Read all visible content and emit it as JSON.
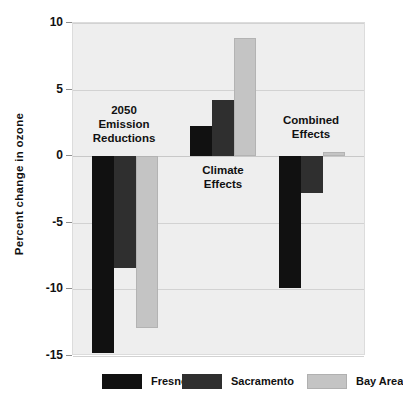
{
  "chart_data": {
    "type": "bar",
    "title": "",
    "xlabel": "",
    "ylabel": "Percent change in ozone",
    "ylim": [
      -15,
      10
    ],
    "yticks": [
      10,
      5,
      0,
      -5,
      -10,
      -15
    ],
    "ytick_labels": [
      "10",
      "5",
      "0",
      "-5",
      "-10",
      "-15"
    ],
    "grid": true,
    "legend_position": "bottom",
    "categories": [
      "2050 Emission Reductions",
      "Climate Effects",
      "Combined Effects"
    ],
    "category_labels": [
      "2050\nEmission\nReductions",
      "Climate\nEffects",
      "Combined\nEffects"
    ],
    "series": [
      {
        "name": "Fresno",
        "color": "#111111",
        "values": [
          -14.8,
          2.3,
          -9.9
        ]
      },
      {
        "name": "Sacramento",
        "color": "#2f2f2f",
        "values": [
          -8.4,
          4.2,
          -2.8
        ]
      },
      {
        "name": "Bay Area",
        "color": "#c4c4c4",
        "values": [
          -12.9,
          8.9,
          0.3
        ]
      }
    ]
  },
  "legend": {
    "items": [
      {
        "label": "Fresno",
        "swatch": "fresno"
      },
      {
        "label": "Sacramento",
        "swatch": "sacramento"
      },
      {
        "label": "Bay Area",
        "swatch": "bayarea"
      }
    ]
  },
  "axis": {
    "y_title": "Percent change in ozone"
  }
}
